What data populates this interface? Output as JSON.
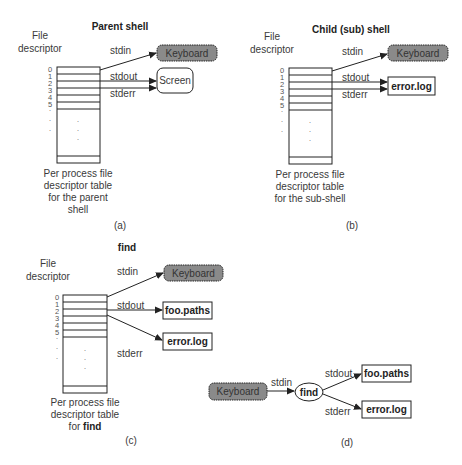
{
  "colors": {
    "keyboard_fill": "#8a8a8a",
    "stroke": "#222222",
    "text": "#3a3a3a",
    "background": "#ffffff"
  },
  "panels": [
    {
      "id": "a",
      "title": "Parent shell",
      "fd_header": [
        "File",
        "descriptor"
      ],
      "fd_numbers": [
        "0",
        "1",
        "2",
        "3",
        "4",
        "5"
      ],
      "streams": {
        "stdin": "stdin",
        "stdout": "stdout",
        "stderr": "stderr"
      },
      "targets": {
        "stdin": "Keyboard",
        "stdout": "Screen",
        "stderr": "Screen"
      },
      "caption": [
        "Per process file",
        "descriptor table",
        "for the parent",
        "shell"
      ],
      "label": "(a)"
    },
    {
      "id": "b",
      "title": "Child (sub) shell",
      "fd_header": [
        "File",
        "descriptor"
      ],
      "fd_numbers": [
        "0",
        "1",
        "2",
        "3",
        "4",
        "5"
      ],
      "streams": {
        "stdin": "stdin",
        "stdout": "stdout",
        "stderr": "stderr"
      },
      "targets": {
        "stdin": "Keyboard",
        "stdout": "error.log",
        "stderr": "error.log"
      },
      "caption": [
        "Per process file",
        "descriptor table",
        "for the sub-shell"
      ],
      "label": "(b)"
    },
    {
      "id": "c",
      "title": "find",
      "fd_header": [
        "File",
        "descriptor"
      ],
      "fd_numbers": [
        "0",
        "1",
        "2",
        "3",
        "4",
        "5"
      ],
      "streams": {
        "stdin": "stdin",
        "stdout": "stdout",
        "stderr": "stderr"
      },
      "targets": {
        "stdin": "Keyboard",
        "stdout": "foo.paths",
        "stderr": "error.log"
      },
      "caption": [
        "Per process file",
        "descriptor table",
        "for ",
        "find"
      ],
      "label": "(c)"
    },
    {
      "id": "d",
      "source": "Keyboard",
      "process": "find",
      "streams": {
        "stdin": "stdin",
        "stdout": "stdout",
        "stderr": "stderr"
      },
      "targets": {
        "stdout": "foo.paths",
        "stderr": "error.log"
      },
      "label": "(d)"
    }
  ]
}
